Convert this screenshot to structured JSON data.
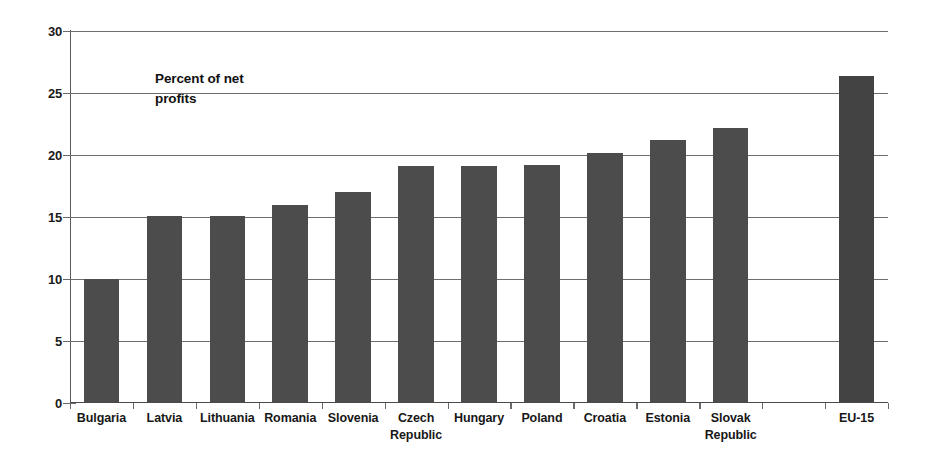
{
  "chart_data": {
    "type": "bar",
    "title": "",
    "subtitle": "",
    "annotation": "Percent of net\nprofits",
    "xlabel": "",
    "ylabel": "Percent of net profits",
    "ylim": [
      0,
      30
    ],
    "yticks": [
      0,
      5,
      10,
      15,
      20,
      25,
      30
    ],
    "ytick_labels": [
      "0",
      "5",
      "10",
      "15",
      "20",
      "25",
      "30"
    ],
    "grid": true,
    "gridlines_at": [
      5,
      10,
      15,
      20,
      25,
      30
    ],
    "legend": null,
    "legend_position": "none",
    "bar_color": "#4c4c4c",
    "highlight_bar_color": "#434343",
    "categories": [
      "Bulgaria",
      "Latvia",
      "Lithuania",
      "Romania",
      "Slovenia",
      "Czech Republic",
      "Hungary",
      "Poland",
      "Croatia",
      "Estonia",
      "Slovak Republic",
      "",
      "EU-15"
    ],
    "category_lines": [
      [
        "Bulgaria"
      ],
      [
        "Latvia"
      ],
      [
        "Lithuania"
      ],
      [
        "Romania"
      ],
      [
        "Slovenia"
      ],
      [
        "Czech",
        "Republic"
      ],
      [
        "Hungary"
      ],
      [
        "Poland"
      ],
      [
        "Croatia"
      ],
      [
        "Estonia"
      ],
      [
        "Slovak",
        "Republic"
      ],
      [
        ""
      ],
      [
        "EU-15"
      ]
    ],
    "values": [
      10.0,
      15.1,
      15.1,
      16.0,
      17.0,
      19.1,
      19.1,
      19.2,
      20.2,
      21.2,
      22.2,
      null,
      26.4
    ]
  }
}
